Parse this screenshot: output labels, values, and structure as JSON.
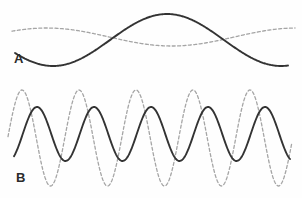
{
  "figure": {
    "width": 302,
    "height": 198,
    "background_color": "#fefefe"
  },
  "panels": [
    {
      "id": "panel-a",
      "label": "A",
      "label_x": 14,
      "label_y": 52,
      "region": {
        "x": 0,
        "y": 0,
        "width": 302,
        "height": 82
      }
    },
    {
      "id": "panel-b",
      "label": "B",
      "label_x": 16,
      "label_y": 171,
      "region": {
        "x": 0,
        "y": 82,
        "width": 302,
        "height": 116
      }
    }
  ],
  "styles": {
    "solid_color": "#333333",
    "solid_width": 1.9,
    "dashed_color": "#a5a5a5",
    "dashed_width": 1.3,
    "dash_pattern": "3,2.4"
  },
  "chart_data": {
    "type": "line",
    "title": "",
    "xlabel": "",
    "ylabel": "",
    "grid": false,
    "legend_position": "none",
    "panels": [
      {
        "name": "A",
        "description": "Low-frequency pair: large-amplitude solid wave and small-amplitude dashed wave, roughly one cycle across the panel.",
        "x_range": [
          0,
          302
        ],
        "y_range": [
          0,
          82
        ],
        "series": [
          {
            "name": "solid-wave-a",
            "style": "solid",
            "color": "#333333",
            "amplitude_px": 26,
            "midline_y": 40,
            "period_px": 228,
            "phase_deg": 210,
            "cycles": 1.3,
            "x_start": 15,
            "x_end": 288,
            "key_points": [
              {
                "x": 15,
                "y": 38,
                "kind": "start"
              },
              {
                "x": 78,
                "y": 14,
                "kind": "peak"
              },
              {
                "x": 185,
                "y": 66,
                "kind": "trough"
              },
              {
                "x": 288,
                "y": 17,
                "kind": "end"
              }
            ]
          },
          {
            "name": "dashed-wave-a",
            "style": "dashed",
            "color": "#a5a5a5",
            "amplitude_px": 9,
            "midline_y": 37,
            "period_px": 250,
            "phase_deg": 40,
            "cycles": 1.15,
            "x_start": 12,
            "x_end": 295,
            "key_points": [
              {
                "x": 12,
                "y": 28,
                "kind": "start"
              },
              {
                "x": 140,
                "y": 46,
                "kind": "trough"
              },
              {
                "x": 268,
                "y": 29,
                "kind": "peak"
              },
              {
                "x": 295,
                "y": 32,
                "kind": "end"
              }
            ]
          }
        ]
      },
      {
        "name": "B",
        "description": "High-frequency pair: large-amplitude dashed wave and smaller-amplitude solid wave, same period, solid lagging dashed.",
        "x_range": [
          0,
          302
        ],
        "y_range": [
          82,
          198
        ],
        "series": [
          {
            "name": "dashed-wave-b",
            "style": "dashed",
            "color": "#a5a5a5",
            "amplitude_px": 48,
            "midline_y": 138,
            "period_px": 57,
            "cycles": 5.3,
            "x_start": 8,
            "x_end": 292,
            "peaks_x": [
              22,
              78,
              135,
              190,
              248
            ],
            "troughs_x": [
              50,
              107,
              163,
              220,
              277
            ],
            "peak_y": 90,
            "trough_y": 186
          },
          {
            "name": "solid-wave-b",
            "style": "solid",
            "color": "#333333",
            "amplitude_px": 27,
            "midline_y": 134,
            "period_px": 57,
            "cycles": 5.1,
            "x_start": 14,
            "x_end": 290,
            "peaks_x": [
              37,
              93,
              150,
              207,
              265
            ],
            "troughs_x": [
              65,
              122,
              178,
              236
            ],
            "peak_y": 107,
            "trough_y": 161
          }
        ]
      }
    ]
  }
}
